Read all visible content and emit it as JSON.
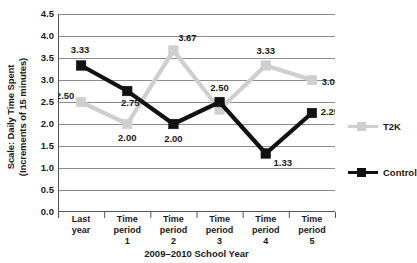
{
  "chart_data": {
    "type": "line",
    "title": "",
    "xlabel": "2009–2010 School Year",
    "ylabel_line1": "Scale: Daily Time Spent",
    "ylabel_line2": "(Increments of 15 minutes)",
    "categories": [
      "Last year",
      "Time period 1",
      "Time period 2",
      "Time period 3",
      "Time period 4",
      "Time period 5"
    ],
    "category_lines": [
      [
        "Last",
        "year"
      ],
      [
        "Time",
        "period",
        "1"
      ],
      [
        "Time",
        "period",
        "2"
      ],
      [
        "Time",
        "period",
        "3"
      ],
      [
        "Time",
        "period",
        "4"
      ],
      [
        "Time",
        "period",
        "5"
      ]
    ],
    "ylim": [
      0.0,
      4.5
    ],
    "yticks": [
      "4.5",
      "4.0",
      "3.5",
      "3.0",
      "2.5",
      "2.0",
      "1.5",
      "1.0",
      "0.5",
      "0.0"
    ],
    "ytick_values": [
      4.5,
      4.0,
      3.5,
      3.0,
      2.5,
      2.0,
      1.5,
      1.0,
      0.5,
      0.0
    ],
    "grid": true,
    "legend_position": "right",
    "series": [
      {
        "name": "T2K",
        "color": "#cfcfcf",
        "values": [
          2.5,
          2.0,
          3.67,
          2.33,
          3.33,
          3.0
        ],
        "labels": [
          "2.50",
          "2.00",
          "3.67",
          "",
          "3.33",
          "3.00"
        ]
      },
      {
        "name": "Control",
        "color": "#111111",
        "values": [
          3.33,
          2.75,
          2.0,
          2.5,
          1.33,
          2.25
        ],
        "labels": [
          "3.33",
          "2.75",
          "2.00",
          "2.50",
          "1.33",
          "2.25"
        ]
      }
    ]
  },
  "legend": {
    "items": [
      {
        "label": "T2K",
        "color": "#cfcfcf"
      },
      {
        "label": "Control",
        "color": "#111111"
      }
    ]
  },
  "axes": {
    "gridline_color": "#8c8c8c",
    "axis_color": "#555555"
  }
}
